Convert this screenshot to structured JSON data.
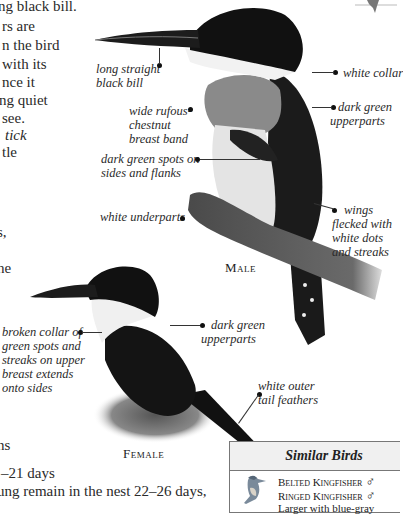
{
  "body_text": {
    "lines": [
      "ng black bill.",
      "rs are",
      "n the bird",
      "with its",
      "nce it",
      "ng quiet",
      "see."
    ],
    "italic_lines": [
      "tick"
    ],
    "line_after_italic": "tle",
    "fragment_s": "s,",
    "fragment_he": "he",
    "fragment_ns": "ns",
    "incubation": "–21 days",
    "nestling": "ung remain in the nest 22–26 days,"
  },
  "male": {
    "caption": "Male",
    "labels": {
      "bill": "long straight\nblack bill",
      "collar": "white collar",
      "breast_band": "wide rufous-\nchestnut\nbreast band",
      "upperparts": "dark green\nupperparts",
      "spots": "dark green spots on\nsides and flanks",
      "underparts": "white underparts",
      "wings": "wings\nflecked with\nwhite dots\nand streaks"
    }
  },
  "female": {
    "caption": "Female",
    "labels": {
      "collar": "broken collar of\ngreen spots and\nstreaks on upper\nbreast extends\nonto sides",
      "upperparts": "dark green\nupperparts",
      "tail": "white outer\ntail feathers"
    }
  },
  "similar_birds": {
    "title": "Similar Birds",
    "items": [
      {
        "name": "Belted Kingfisher",
        "sex_symbol": "♂"
      },
      {
        "name": "Ringed Kingfisher",
        "sex_symbol": "♂"
      }
    ],
    "note": "Larger with blue-gray"
  },
  "colors": {
    "text": "#2a2a2a",
    "header_bg": "#f0f0f0",
    "border": "#777777"
  }
}
